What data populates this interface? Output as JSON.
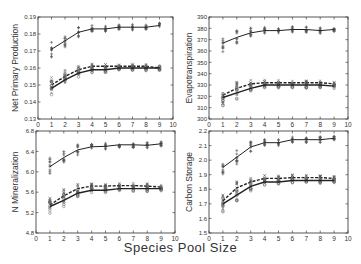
{
  "figure": {
    "xlabel": "Species Pool Size"
  },
  "chart_data": [
    {
      "type": "line",
      "title": "",
      "ylabel": "Net Primary Production",
      "xlabel": "Species Pool Size",
      "xlim": [
        0,
        10
      ],
      "ylim": [
        0.13,
        0.19
      ],
      "xticks": [
        "0",
        "1",
        "2",
        "3",
        "4",
        "5",
        "6",
        "7",
        "8",
        "9",
        "10"
      ],
      "yticks": [
        "0.13",
        "0.14",
        "0.15",
        "0.16",
        "0.17",
        "0.18",
        "0.19"
      ],
      "x": [
        1,
        2,
        3,
        4,
        5,
        6,
        7,
        8,
        9
      ],
      "series": [
        {
          "name": "upper",
          "style": "solid",
          "values": [
            0.171,
            0.176,
            0.181,
            0.183,
            0.183,
            0.184,
            0.184,
            0.184,
            0.185
          ]
        },
        {
          "name": "middle-dashed",
          "style": "dashed",
          "values": [
            0.15,
            0.155,
            0.159,
            0.161,
            0.161,
            0.161,
            0.161,
            0.161,
            0.16
          ]
        },
        {
          "name": "lower",
          "style": "solid",
          "values": [
            0.148,
            0.153,
            0.157,
            0.159,
            0.159,
            0.16,
            0.16,
            0.16,
            0.16
          ]
        }
      ],
      "grid": false
    },
    {
      "type": "line",
      "title": "",
      "ylabel": "Evapotranspiration",
      "xlabel": "Species Pool Size",
      "xlim": [
        0,
        10
      ],
      "ylim": [
        300,
        390
      ],
      "xticks": [
        "0",
        "1",
        "2",
        "3",
        "4",
        "5",
        "6",
        "7",
        "8",
        "9",
        "10"
      ],
      "yticks": [
        "300",
        "310",
        "320",
        "330",
        "340",
        "350",
        "360",
        "370",
        "380",
        "390"
      ],
      "x": [
        1,
        2,
        3,
        4,
        5,
        6,
        7,
        8,
        9
      ],
      "series": [
        {
          "name": "upper",
          "style": "solid",
          "values": [
            367,
            372,
            376,
            378,
            378,
            379,
            379,
            378,
            379
          ]
        },
        {
          "name": "middle-dashed",
          "style": "dashed",
          "values": [
            321,
            327,
            331,
            332,
            332,
            332,
            332,
            332,
            331
          ]
        },
        {
          "name": "lower",
          "style": "solid",
          "values": [
            319,
            323,
            327,
            330,
            330,
            330,
            330,
            330,
            329
          ]
        }
      ],
      "grid": false
    },
    {
      "type": "line",
      "title": "",
      "ylabel": "N Mineralization",
      "xlabel": "Species Pool Size",
      "xlim": [
        0,
        10
      ],
      "ylim": [
        4.8,
        6.8
      ],
      "xticks": [
        "0",
        "1",
        "2",
        "3",
        "4",
        "5",
        "6",
        "7",
        "8",
        "9",
        "10"
      ],
      "yticks": [
        "4.8",
        "5.2",
        "5.6",
        "6.0",
        "6.4",
        "6.8"
      ],
      "x": [
        1,
        2,
        3,
        4,
        5,
        6,
        7,
        8,
        9
      ],
      "series": [
        {
          "name": "upper",
          "style": "solid",
          "values": [
            6.1,
            6.28,
            6.43,
            6.49,
            6.5,
            6.53,
            6.53,
            6.52,
            6.55
          ]
        },
        {
          "name": "middle-dashed",
          "style": "dashed",
          "values": [
            5.35,
            5.53,
            5.67,
            5.72,
            5.72,
            5.73,
            5.73,
            5.72,
            5.7
          ]
        },
        {
          "name": "lower",
          "style": "solid",
          "values": [
            5.32,
            5.44,
            5.58,
            5.64,
            5.64,
            5.67,
            5.67,
            5.67,
            5.67
          ]
        }
      ],
      "grid": false
    },
    {
      "type": "line",
      "title": "",
      "ylabel": "Carbon Storage",
      "xlabel": "Species Pool Size",
      "xlim": [
        0,
        10
      ],
      "ylim": [
        1.5,
        2.2
      ],
      "xticks": [
        "0",
        "1",
        "2",
        "3",
        "4",
        "5",
        "6",
        "7",
        "8",
        "9",
        "10"
      ],
      "yticks": [
        "1.5",
        "1.6",
        "1.7",
        "1.8",
        "1.9",
        "2.0",
        "2.1",
        "2.2"
      ],
      "x": [
        1,
        2,
        3,
        4,
        5,
        6,
        7,
        8,
        9
      ],
      "series": [
        {
          "name": "upper",
          "style": "solid",
          "values": [
            1.95,
            2.02,
            2.09,
            2.12,
            2.12,
            2.14,
            2.14,
            2.14,
            2.15
          ]
        },
        {
          "name": "middle-dashed",
          "style": "dashed",
          "values": [
            1.72,
            1.81,
            1.85,
            1.875,
            1.875,
            1.88,
            1.88,
            1.88,
            1.875
          ]
        },
        {
          "name": "lower",
          "style": "solid",
          "values": [
            1.7,
            1.76,
            1.82,
            1.85,
            1.85,
            1.86,
            1.86,
            1.86,
            1.86
          ]
        }
      ],
      "grid": false
    }
  ],
  "layout": {
    "panels": [
      {
        "left": 38,
        "top": 17,
        "width": 135,
        "height": 102,
        "ylabel_x": 12
      },
      {
        "left": 209,
        "top": 17,
        "width": 139,
        "height": 102,
        "ylabel_x": 186
      },
      {
        "left": 36,
        "top": 131,
        "width": 139,
        "height": 102,
        "ylabel_x": 12
      },
      {
        "left": 209,
        "top": 131,
        "width": 139,
        "height": 102,
        "ylabel_x": 186
      }
    ]
  }
}
